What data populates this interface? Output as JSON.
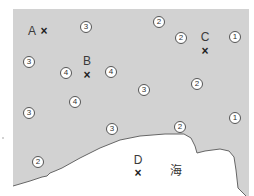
{
  "map": {
    "colors": {
      "land": "#d2d2d2",
      "sea": "#ffffff",
      "coast": "#666666"
    },
    "points": [
      {
        "id": "A",
        "label": "A",
        "mark": "×",
        "label_pos": [
          32,
          31
        ],
        "mark_pos": [
          44,
          31
        ]
      },
      {
        "id": "B",
        "label": "B",
        "mark": "×",
        "label_pos": [
          87,
          61
        ],
        "mark_pos": [
          87,
          75
        ]
      },
      {
        "id": "C",
        "label": "C",
        "mark": "×",
        "label_pos": [
          205,
          37
        ],
        "mark_pos": [
          205,
          51
        ]
      },
      {
        "id": "D",
        "label": "D",
        "mark": "×",
        "label_pos": [
          138,
          160
        ],
        "mark_pos": [
          138,
          173
        ]
      }
    ],
    "values": [
      {
        "v": "③",
        "pos": [
          86,
          27
        ]
      },
      {
        "v": "②",
        "pos": [
          159,
          22
        ]
      },
      {
        "v": "②",
        "pos": [
          181,
          38
        ]
      },
      {
        "v": "①",
        "pos": [
          235,
          37
        ]
      },
      {
        "v": "③",
        "pos": [
          29,
          62
        ]
      },
      {
        "v": "④",
        "pos": [
          66,
          73
        ]
      },
      {
        "v": "④",
        "pos": [
          111,
          72
        ]
      },
      {
        "v": "③",
        "pos": [
          144,
          90
        ]
      },
      {
        "v": "②",
        "pos": [
          197,
          84
        ]
      },
      {
        "v": "③",
        "pos": [
          29,
          113
        ]
      },
      {
        "v": "④",
        "pos": [
          75,
          102
        ]
      },
      {
        "v": "③",
        "pos": [
          112,
          129
        ]
      },
      {
        "v": "②",
        "pos": [
          180,
          127
        ]
      },
      {
        "v": "①",
        "pos": [
          235,
          118
        ]
      },
      {
        "v": "②",
        "pos": [
          38,
          162
        ]
      }
    ],
    "sea_label": {
      "text": "海",
      "pos": [
        176,
        171
      ]
    }
  }
}
